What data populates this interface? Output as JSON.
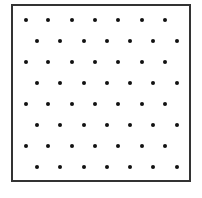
{
  "diagram": {
    "type": "dot-grid",
    "frame": {
      "left": 11,
      "top": 4,
      "right": 191,
      "bottom": 182,
      "border_width": 2,
      "border_color": "#333333",
      "fill": "#ffffff"
    },
    "dot_style": {
      "diameter": 4,
      "color": "#111111"
    },
    "grid": {
      "rows": 8,
      "dots_per_row": 7,
      "first_row_y": 20,
      "row_spacing": 21,
      "odd_row_x": [
        26,
        48,
        72,
        95,
        118,
        142,
        165
      ],
      "even_row_x": [
        37,
        60,
        84,
        107,
        130,
        153,
        177
      ]
    }
  }
}
